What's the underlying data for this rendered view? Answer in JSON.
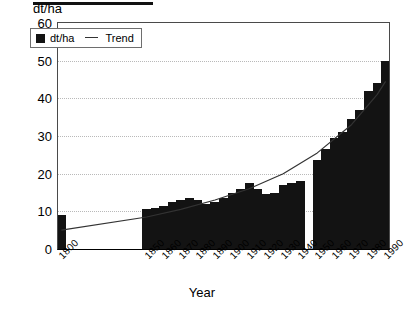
{
  "clipped_title": "",
  "axis": {
    "y_label": "dt/ha",
    "x_label": "Year",
    "y_ticks": [
      "0",
      "10",
      "20",
      "30",
      "40",
      "50",
      "60"
    ],
    "x_ticks": [
      "1800",
      "1850",
      "1860",
      "1870",
      "1880",
      "1890",
      "1900",
      "1910",
      "1920",
      "1930",
      "1940",
      "1950",
      "1960",
      "1970",
      "1980",
      "1990"
    ]
  },
  "legend": {
    "series_label": "dt/ha",
    "trend_label": "Trend",
    "series_color": "#131313",
    "trend_color": "#333333"
  },
  "chart_data": {
    "type": "bar",
    "title": "",
    "xlabel": "Year",
    "ylabel": "dt/ha",
    "ylim": [
      0,
      60
    ],
    "ytick_step": 10,
    "grid": true,
    "legend_position": "top-left",
    "x": [
      1800,
      1850,
      1855,
      1860,
      1865,
      1870,
      1875,
      1880,
      1885,
      1890,
      1895,
      1900,
      1905,
      1910,
      1915,
      1920,
      1925,
      1930,
      1935,
      1940,
      1950,
      1955,
      1960,
      1965,
      1970,
      1975,
      1980,
      1985,
      1990
    ],
    "categories": [
      "1800",
      "1850",
      "1855",
      "1860",
      "1865",
      "1870",
      "1875",
      "1880",
      "1885",
      "1890",
      "1895",
      "1900",
      "1905",
      "1910",
      "1915",
      "1920",
      "1925",
      "1930",
      "1935",
      "1940",
      "1950",
      "1955",
      "1960",
      "1965",
      "1970",
      "1975",
      "1980",
      "1985",
      "1990"
    ],
    "values": [
      9.0,
      10.5,
      11.0,
      11.5,
      12.5,
      13.0,
      13.5,
      13.0,
      12.0,
      12.5,
      13.5,
      15.0,
      16.0,
      17.5,
      16.0,
      14.5,
      15.0,
      17.0,
      17.5,
      18.0,
      23.5,
      26.5,
      29.5,
      31.0,
      34.5,
      37.0,
      42.0,
      44.0,
      50.0
    ],
    "series": [
      {
        "name": "dt/ha",
        "type": "bar",
        "color": "#131313",
        "values": [
          9.0,
          10.5,
          11.0,
          11.5,
          12.5,
          13.0,
          13.5,
          13.0,
          12.0,
          12.5,
          13.5,
          15.0,
          16.0,
          17.5,
          16.0,
          14.5,
          15.0,
          17.0,
          17.5,
          18.0,
          23.5,
          26.5,
          29.5,
          31.0,
          34.5,
          37.0,
          42.0,
          44.0,
          50.0
        ]
      },
      {
        "name": "Trend",
        "type": "line",
        "color": "#333333",
        "x": [
          1800,
          1850,
          1870,
          1890,
          1910,
          1930,
          1950,
          1970,
          1985,
          1990
        ],
        "values": [
          5.0,
          8.5,
          10.5,
          13.0,
          16.0,
          20.0,
          25.5,
          33.0,
          41.0,
          44.5
        ]
      }
    ],
    "gap_note": "no bars plotted between 1940 and 1950"
  }
}
